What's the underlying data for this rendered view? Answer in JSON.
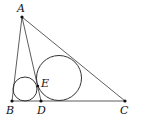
{
  "diagram": {
    "type": "geometry",
    "colors": {
      "stroke": "#333333",
      "point": "#111111",
      "background": "#ffffff"
    },
    "points": {
      "A": {
        "label": "A",
        "x": 22,
        "y": 17,
        "lx": 17,
        "ly": 12
      },
      "B": {
        "label": "B",
        "x": 12,
        "y": 101,
        "lx": 6,
        "ly": 114
      },
      "D": {
        "label": "D",
        "x": 41,
        "y": 101,
        "lx": 37,
        "ly": 114
      },
      "C": {
        "label": "C",
        "x": 125,
        "y": 101,
        "lx": 120,
        "ly": 114
      },
      "E": {
        "label": "E",
        "x": 38,
        "y": 85,
        "lx": 41,
        "ly": 87
      }
    },
    "segments": [
      [
        "A",
        "B"
      ],
      [
        "A",
        "C"
      ],
      [
        "A",
        "D"
      ],
      [
        "B",
        "C"
      ]
    ],
    "circles": [
      {
        "name": "small-incircle",
        "cx": 25,
        "cy": 89,
        "r": 12
      },
      {
        "name": "large-incircle",
        "cx": 59,
        "cy": 78,
        "r": 22.5
      }
    ]
  }
}
